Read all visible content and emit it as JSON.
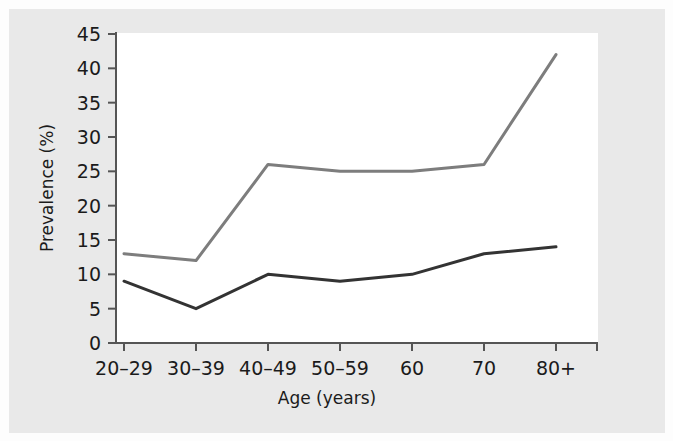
{
  "chart_data": {
    "type": "line",
    "title": "",
    "xlabel": "Age (years)",
    "ylabel": "Prevalence (%)",
    "categories": [
      "20–29",
      "30–39",
      "40–49",
      "50–59",
      "60",
      "70",
      "80+"
    ],
    "ylim": [
      0,
      45
    ],
    "yticks": [
      0,
      5,
      10,
      15,
      20,
      25,
      30,
      35,
      40,
      45
    ],
    "ytick_labels": [
      "0",
      "5",
      "10",
      "15",
      "20",
      "25",
      "30",
      "35",
      "40",
      "45"
    ],
    "grid": false,
    "legend": "none",
    "series": [
      {
        "name": "upper-series",
        "color": "#7d7d7d",
        "values": [
          13,
          12,
          26,
          25,
          25,
          26,
          42
        ]
      },
      {
        "name": "lower-series",
        "color": "#333333",
        "values": [
          9,
          5,
          10,
          9,
          10,
          13,
          14
        ]
      }
    ]
  },
  "axes": {
    "y_axis_title": "Prevalence (%)",
    "x_axis_title": "Age (years)"
  },
  "colors": {
    "page_background": "#e9e9e9",
    "plot_background": "#ffffff",
    "axis": "#555555",
    "text": "#1b1b1b",
    "series_upper": "#7d7d7d",
    "series_lower": "#333333"
  }
}
